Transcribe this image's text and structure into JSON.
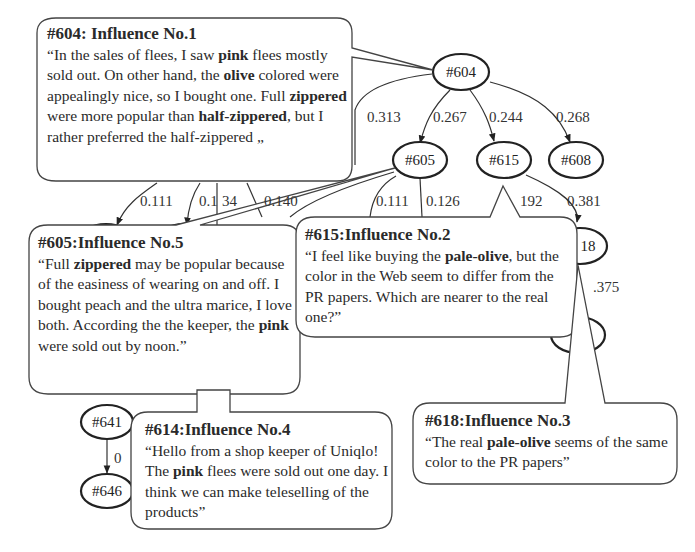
{
  "nodes": [
    {
      "id": "604",
      "label": "#604"
    },
    {
      "id": "605",
      "label": "#605"
    },
    {
      "id": "615",
      "label": "#615"
    },
    {
      "id": "608",
      "label": "#608"
    },
    {
      "id": "618",
      "label": "18"
    },
    {
      "id": "6x",
      "label": "#6"
    },
    {
      "id": "641",
      "label": "#641"
    },
    {
      "id": "646",
      "label": "#646"
    }
  ],
  "edges": [
    {
      "from": "604",
      "to": "?",
      "label": "0.313"
    },
    {
      "from": "604",
      "to": "605",
      "label": "0.267"
    },
    {
      "from": "604",
      "to": "615",
      "label": "0.244"
    },
    {
      "from": "604",
      "to": "608",
      "label": "0.268"
    },
    {
      "from": "?",
      "to": "?",
      "label": "0.111"
    },
    {
      "from": "?",
      "to": "?",
      "label": "0.134",
      "display": "0.1|34"
    },
    {
      "from": "?",
      "to": "?",
      "label": "0.140"
    },
    {
      "from": "605",
      "to": "?",
      "label": "0.111"
    },
    {
      "from": "605",
      "to": "?",
      "label": "0.126"
    },
    {
      "from": "615",
      "to": "?",
      "label": "192"
    },
    {
      "from": "615",
      "to": "618",
      "label": "0.381"
    },
    {
      "from": "618",
      "to": "6x",
      "label": ".375"
    },
    {
      "from": "641",
      "to": "646",
      "label": "0"
    }
  ],
  "edge_labels": {
    "e313": "0.313",
    "e267": "0.267",
    "e244": "0.244",
    "e268": "0.268",
    "e111a": "0.111",
    "e134a": "0.1",
    "e134b": "34",
    "e140": "0.140",
    "e111b": "0.111",
    "e126": "0.126",
    "e192": "192",
    "e381": "0.381",
    "e375": ".375",
    "e0": "0"
  },
  "node_labels": {
    "n604": "#604",
    "n605": "#605",
    "n615": "#615",
    "n608": "#608",
    "n618": "18",
    "n6x": "#6",
    "n641": "#641",
    "n646": "#646"
  },
  "bubbles": {
    "b604": {
      "title": "#604: Influence No.1",
      "parts": [
        "“In the sales of flees, I saw ",
        "pink",
        " flees mostly sold out. On other hand, the ",
        "olive",
        " colored were appealingly nice, so I bought one. Full ",
        "zippered",
        " were more popular than ",
        "half-zippered",
        ", but I rather preferred the half-zippered     „"
      ]
    },
    "b605": {
      "title": "#605:Influence No.5",
      "parts": [
        "“Full ",
        "zippered",
        " may be popular because of the easiness of wearing on and off. I bought peach and the ultra marice, I love both. According the the keeper, the ",
        "pink",
        " were sold out by noon.”"
      ]
    },
    "b615": {
      "title": "#615:Influence No.2",
      "parts": [
        "“I feel like buying the ",
        "pale-olive",
        ", but the color in the Web seem to differ from the PR papers. Which are nearer to the real one?”"
      ]
    },
    "b618": {
      "title": "#618:Influence No.3",
      "parts": [
        "“The real ",
        "pale-olive",
        " seems of the same color to the PR papers”"
      ]
    },
    "b614": {
      "title": "#614:Influence No.4",
      "parts": [
        "“Hello from a shop keeper of Uniqlo! The ",
        "pink",
        " flees were sold out one day. I think we can make teleselling of the products”"
      ]
    }
  }
}
